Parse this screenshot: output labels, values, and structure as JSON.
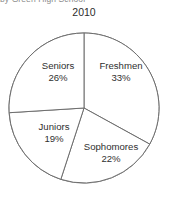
{
  "header": {
    "clipped_heading": "by Green High School",
    "year_label": "2010"
  },
  "colors": {
    "background": "#ffffff",
    "outline": "#6e6e6e",
    "slice_fill": "#ffffff",
    "label_text": "#2f2f2f",
    "year_text": "#2b2b2b",
    "clipped_text": "#8d8d8d"
  },
  "chart_data": {
    "type": "pie",
    "title": "2010",
    "xlabel": "",
    "ylabel": "",
    "grid": false,
    "legend_position": "none",
    "labels_inside_slices": true,
    "start_angle_deg": 0,
    "direction": "clockwise",
    "geometry": {
      "center_x": 84,
      "center_y": 108,
      "radius": 75
    },
    "categories": [
      "Freshmen",
      "Sophomores",
      "Juniors",
      "Seniors"
    ],
    "values": [
      33,
      22,
      19,
      26
    ],
    "value_unit": "%",
    "slices": [
      {
        "label": "Freshmen",
        "percent": 33,
        "percent_text": "33%",
        "start_deg": 0,
        "end_deg": 118.8,
        "fill": "#ffffff"
      },
      {
        "label": "Sophomores",
        "percent": 22,
        "percent_text": "22%",
        "start_deg": 118.8,
        "end_deg": 198.0,
        "fill": "#ffffff"
      },
      {
        "label": "Juniors",
        "percent": 19,
        "percent_text": "19%",
        "start_deg": 198.0,
        "end_deg": 266.4,
        "fill": "#ffffff"
      },
      {
        "label": "Seniors",
        "percent": 26,
        "percent_text": "26%",
        "start_deg": 266.4,
        "end_deg": 360.0,
        "fill": "#ffffff"
      }
    ]
  }
}
